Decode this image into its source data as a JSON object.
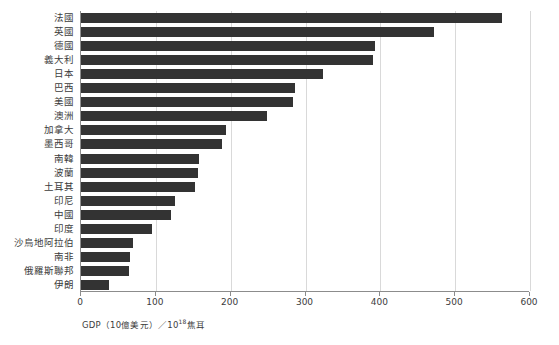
{
  "chart_data": {
    "type": "bar",
    "orientation": "horizontal",
    "title": "",
    "subtitle": "",
    "xlabel": "GDP（10億美元）／10¹⁸焦耳",
    "ylabel": "",
    "xlim": [
      0,
      600
    ],
    "grid": true,
    "legend": false,
    "legend_position": "none",
    "bar_color": "#333333",
    "axis_color": "#8c8c8c",
    "gridline_color": "#d9d9d9",
    "xticks": [
      0,
      100,
      200,
      300,
      400,
      500,
      600
    ],
    "xticklabels": [
      "0",
      "100",
      "200",
      "300",
      "400",
      "500",
      "600"
    ],
    "categories": [
      "法國",
      "英國",
      "德國",
      "義大利",
      "日本",
      "巴西",
      "美國",
      "澳洲",
      "加拿大",
      "墨西哥",
      "南韓",
      "波蘭",
      "土耳其",
      "印尼",
      "中國",
      "印度",
      "沙烏地阿拉伯",
      "南非",
      "俄羅斯聯邦",
      "伊朗"
    ],
    "values": [
      563,
      472,
      393,
      390,
      323,
      286,
      283,
      249,
      194,
      188,
      158,
      156,
      152,
      125,
      120,
      95,
      70,
      66,
      64,
      37
    ]
  },
  "axis_label_parts": {
    "prefix": "GDP（10億美元）／10",
    "exponent": "18",
    "suffix": "焦耳"
  }
}
